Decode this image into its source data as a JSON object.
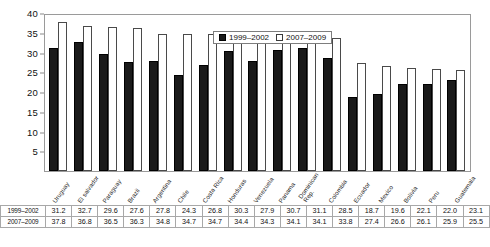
{
  "chart_data": {
    "type": "bar",
    "title": "",
    "subtitle": "",
    "xlabel": "",
    "ylabel": "",
    "ylim": [
      0,
      40
    ],
    "yticks": [
      0,
      5,
      10,
      15,
      20,
      25,
      30,
      35,
      40
    ],
    "grid": false,
    "legend_position": "top-center-inside",
    "categories": [
      "Uruguay",
      "El salvador",
      "Paraguay",
      "Brazil",
      "Argentina",
      "Chile",
      "Costa Rica",
      "Honduras",
      "Venezuela",
      "Panama",
      "Dominican Rep.",
      "Colombia",
      "Ecuador",
      "Mexico",
      "Bolivia",
      "Peru",
      "Guatemala"
    ],
    "series": [
      {
        "name": "1999–2002",
        "color": "#1a1a1a",
        "fill": "solid",
        "values": [
          31.2,
          32.7,
          29.6,
          27.6,
          27.8,
          24.3,
          26.8,
          30.3,
          27.9,
          30.7,
          31.1,
          28.5,
          18.7,
          19.6,
          22.1,
          22.0,
          23.1
        ]
      },
      {
        "name": "2007–2009",
        "color": "#ffffff",
        "fill": "hollow",
        "values": [
          37.8,
          36.8,
          36.5,
          36.3,
          34.8,
          34.7,
          34.7,
          34.4,
          34.3,
          34.1,
          34.1,
          33.8,
          27.4,
          26.6,
          26.1,
          25.9,
          25.5
        ]
      }
    ]
  },
  "legend": {
    "entries": [
      {
        "label": "1999–2002",
        "swatch": "filled"
      },
      {
        "label": "2007–2009",
        "swatch": "hollow"
      }
    ]
  },
  "table": {
    "rows": [
      {
        "header": "1999–2002",
        "values": [
          "31.2",
          "32.7",
          "29.6",
          "27.6",
          "27.8",
          "24.3",
          "26.8",
          "30.3",
          "27.9",
          "30.7",
          "31.1",
          "28.5",
          "18.7",
          "19.6",
          "22.1",
          "22.0",
          "23.1"
        ]
      },
      {
        "header": "2007–2009",
        "values": [
          "37.8",
          "36.8",
          "36.5",
          "36.3",
          "34.8",
          "34.7",
          "34.7",
          "34.4",
          "34.3",
          "34.1",
          "34.1",
          "33.8",
          "27.4",
          "26.6",
          "26.1",
          "25.9",
          "25.5"
        ]
      }
    ]
  },
  "axis": {
    "y_tick_labels": [
      "40",
      "35",
      "30",
      "25",
      "20",
      "15",
      "10",
      "5",
      "0"
    ]
  }
}
